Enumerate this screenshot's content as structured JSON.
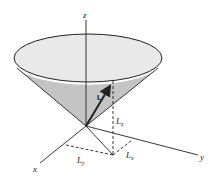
{
  "diagram": {
    "colors": {
      "cone_side": "#c4c4c4",
      "cone_top": "#e8e8e8",
      "stroke": "#222222"
    },
    "labels": {
      "z_axis": "z",
      "x_axis": "x",
      "y_axis": "y",
      "vector": "L",
      "lz": "L",
      "lz_sub": "z",
      "ly": "L",
      "ly_sub": "y",
      "lx": "L",
      "lx_sub": "x"
    }
  }
}
